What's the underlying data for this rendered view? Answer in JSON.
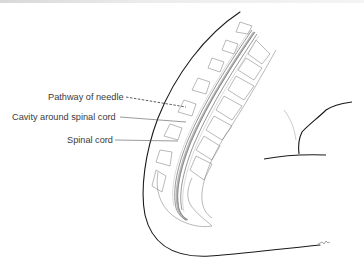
{
  "figure": {
    "type": "medical-illustration",
    "labels": [
      {
        "id": "pathway",
        "text": "Pathway of needle"
      },
      {
        "id": "cavity",
        "text": "Cavity around spinal cord"
      },
      {
        "id": "cord",
        "text": "Spinal cord"
      }
    ],
    "signature": "signature scribble (illegible)"
  }
}
